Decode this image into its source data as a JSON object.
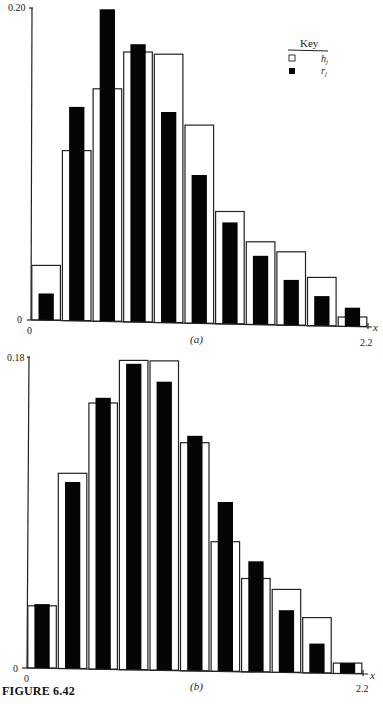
{
  "figure": {
    "caption": "FIGURE 6.42",
    "key": {
      "title": "Key",
      "items": [
        {
          "symbol": "h",
          "sub": "j",
          "style": "hollow"
        },
        {
          "symbol": "r",
          "sub": "j",
          "style": "filled"
        }
      ]
    }
  },
  "chart_data": [
    {
      "type": "bar",
      "panel": "(a)",
      "title": "",
      "xlabel": "x",
      "ylabel": "",
      "xlim": [
        0,
        2.2
      ],
      "ylim": [
        0,
        0.2
      ],
      "x_tick_labels": [
        "0",
        "2.2"
      ],
      "y_tick_labels": [
        "0",
        "0.20"
      ],
      "bin_width": 0.2,
      "categories": [
        "0.0-0.2",
        "0.2-0.4",
        "0.4-0.6",
        "0.6-0.8",
        "0.8-1.0",
        "1.0-1.2",
        "1.2-1.4",
        "1.4-1.6",
        "1.6-1.8",
        "1.8-2.0",
        "2.0-2.2"
      ],
      "series": [
        {
          "name": "h_j",
          "style": "hollow",
          "values": [
            0.035,
            0.109,
            0.149,
            0.173,
            0.172,
            0.127,
            0.072,
            0.053,
            0.047,
            0.031,
            0.006
          ]
        },
        {
          "name": "r_j",
          "style": "filled",
          "values": [
            0.017,
            0.137,
            0.2,
            0.178,
            0.135,
            0.095,
            0.065,
            0.044,
            0.029,
            0.019,
            0.012
          ]
        }
      ],
      "legend_position": "upper right",
      "grid": false
    },
    {
      "type": "bar",
      "panel": "(b)",
      "title": "",
      "xlabel": "x",
      "ylabel": "",
      "xlim": [
        0,
        2.2
      ],
      "ylim": [
        0,
        0.18
      ],
      "x_tick_labels": [
        "0",
        "2.2"
      ],
      "y_tick_labels": [
        "0",
        "0.18"
      ],
      "bin_width": 0.2,
      "categories": [
        "0.0-0.2",
        "0.2-0.4",
        "0.4-0.6",
        "0.6-0.8",
        "0.8-1.0",
        "1.0-1.2",
        "1.2-1.4",
        "1.4-1.6",
        "1.6-1.8",
        "1.8-2.0",
        "2.0-2.2"
      ],
      "series": [
        {
          "name": "h_j",
          "style": "hollow",
          "values": [
            0.036,
            0.113,
            0.154,
            0.179,
            0.179,
            0.132,
            0.075,
            0.054,
            0.048,
            0.032,
            0.006
          ]
        },
        {
          "name": "r_j",
          "style": "filled",
          "values": [
            0.037,
            0.108,
            0.157,
            0.177,
            0.167,
            0.136,
            0.098,
            0.064,
            0.036,
            0.017,
            0.006
          ]
        }
      ],
      "legend_position": "none",
      "grid": false
    }
  ]
}
